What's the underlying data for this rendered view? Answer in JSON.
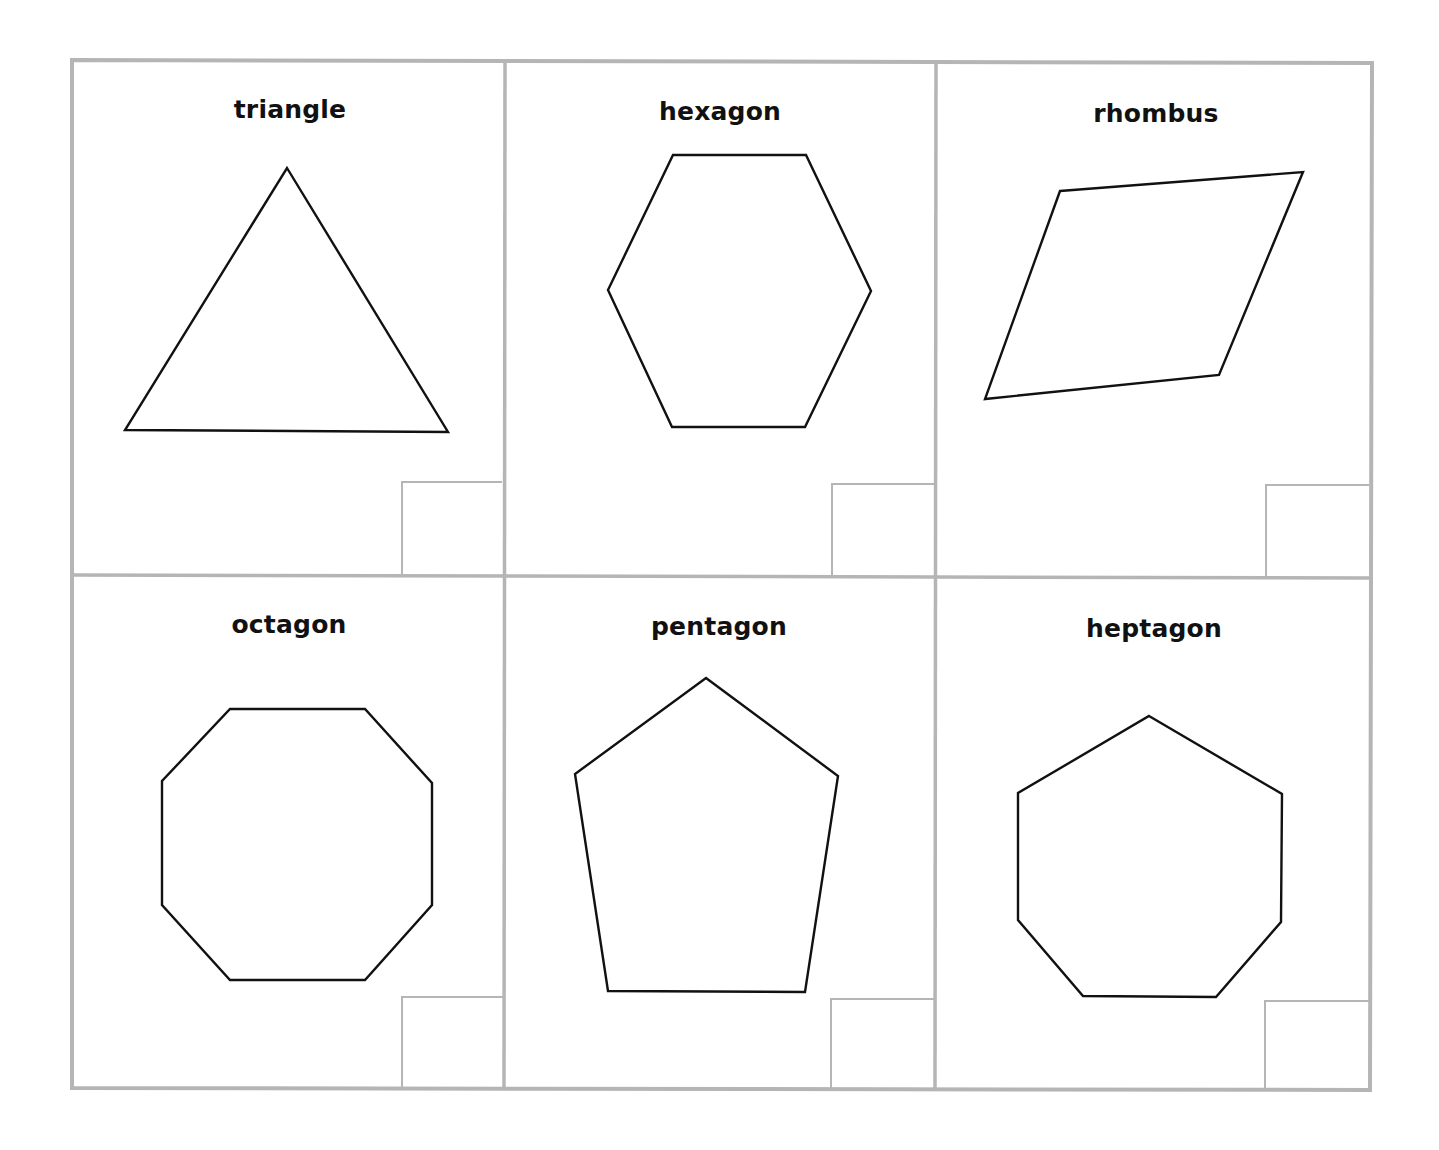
{
  "worksheet": {
    "border_color": "#b5b5b5",
    "shape_stroke": "#111111",
    "background": "#ffffff",
    "grid": {
      "rows": 2,
      "columns": 3
    },
    "cards": [
      {
        "label": "triangle",
        "sides": 3,
        "label_center": [
          290,
          111
        ],
        "points": [
          [
            287,
            168
          ],
          [
            448,
            432
          ],
          [
            125,
            430
          ]
        ],
        "answer_box": [
          402,
          482,
          502,
          575
        ]
      },
      {
        "label": "hexagon",
        "sides": 6,
        "label_center": [
          720,
          113
        ],
        "points": [
          [
            673,
            155
          ],
          [
            806,
            155
          ],
          [
            871,
            291
          ],
          [
            805,
            427
          ],
          [
            672,
            427
          ],
          [
            608,
            290
          ]
        ],
        "answer_box": [
          832,
          484,
          935,
          577
        ]
      },
      {
        "label": "rhombus",
        "sides": 4,
        "label_center": [
          1156,
          115
        ],
        "points": [
          [
            1060,
            191
          ],
          [
            1303,
            172
          ],
          [
            1219,
            375
          ],
          [
            985,
            399
          ]
        ],
        "answer_box": [
          1266,
          485,
          1369,
          578
        ]
      },
      {
        "label": "octagon",
        "sides": 8,
        "label_center": [
          289,
          626
        ],
        "points": [
          [
            230,
            709
          ],
          [
            365,
            709
          ],
          [
            432,
            783
          ],
          [
            432,
            905
          ],
          [
            365,
            980
          ],
          [
            230,
            980
          ],
          [
            162,
            905
          ],
          [
            162,
            781
          ]
        ],
        "answer_box": [
          402,
          997,
          503,
          1088
        ]
      },
      {
        "label": "pentagon",
        "sides": 5,
        "label_center": [
          719,
          628
        ],
        "points": [
          [
            706,
            678
          ],
          [
            838,
            776
          ],
          [
            805,
            992
          ],
          [
            608,
            991
          ],
          [
            575,
            774
          ]
        ],
        "answer_box": [
          831,
          999,
          935,
          1089
        ]
      },
      {
        "label": "heptagon",
        "sides": 7,
        "label_center": [
          1154,
          630
        ],
        "points": [
          [
            1149,
            716
          ],
          [
            1282,
            794
          ],
          [
            1281,
            922
          ],
          [
            1216,
            997
          ],
          [
            1083,
            996
          ],
          [
            1018,
            920
          ],
          [
            1018,
            793
          ]
        ],
        "answer_box": [
          1265,
          1001,
          1369,
          1090
        ]
      }
    ]
  }
}
